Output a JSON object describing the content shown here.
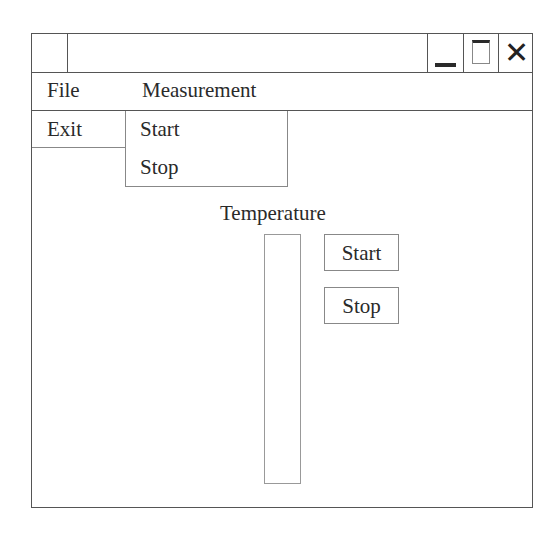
{
  "window": {
    "title": "",
    "controls": {
      "minimize": "minimize-icon",
      "maximize": "maximize-icon",
      "close": "close-icon",
      "close_glyph": "✕"
    }
  },
  "menubar": {
    "items": [
      {
        "label": "File",
        "dropdown": [
          {
            "label": "Exit"
          }
        ]
      },
      {
        "label": "Measurement",
        "dropdown": [
          {
            "label": "Start"
          },
          {
            "label": "Stop"
          }
        ]
      }
    ]
  },
  "main": {
    "temperature_label": "Temperature",
    "buttons": {
      "start": "Start",
      "stop": "Stop"
    }
  }
}
